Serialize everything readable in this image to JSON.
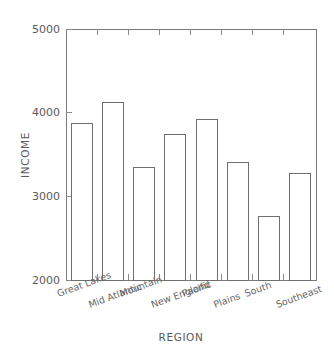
{
  "chart_data": {
    "type": "bar",
    "title": "",
    "xlabel": "REGION",
    "ylabel": "INCOME",
    "categories": [
      "Great Lakes",
      "Mid Atlantic",
      "Mountain",
      "New England",
      "Pacific",
      "Plains",
      "South",
      "Southeast"
    ],
    "values": [
      3870,
      4120,
      3345,
      3735,
      3915,
      3405,
      2760,
      3275
    ],
    "ylim": [
      2000,
      5000
    ],
    "ytick_labels": [
      "2000",
      "3000",
      "4000",
      "5000"
    ],
    "ytick_values": [
      2000,
      3000,
      4000,
      5000
    ],
    "grid": false,
    "legend": null,
    "bar_fill": "#ffffff",
    "bar_stroke": "#6f6f6f",
    "axis_color": "#7a7a7a",
    "text_color": "#5a5a5a",
    "background": "#ffffff",
    "xtick_label_rotation_deg": -20
  }
}
